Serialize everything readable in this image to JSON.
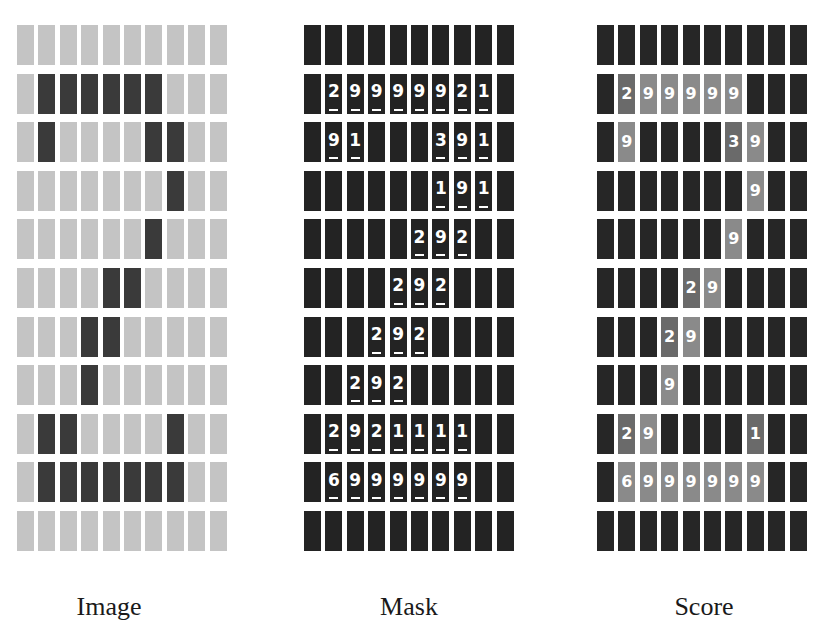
{
  "figure": {
    "rows": 11,
    "cols": 10,
    "panels": [
      {
        "id": "image",
        "caption": "Image",
        "cells": [
          [
            0,
            0,
            0,
            0,
            0,
            0,
            0,
            0,
            0,
            0
          ],
          [
            0,
            1,
            1,
            1,
            1,
            1,
            1,
            0,
            0,
            0
          ],
          [
            0,
            1,
            0,
            0,
            0,
            0,
            1,
            1,
            0,
            0
          ],
          [
            0,
            0,
            0,
            0,
            0,
            0,
            0,
            1,
            0,
            0
          ],
          [
            0,
            0,
            0,
            0,
            0,
            0,
            1,
            0,
            0,
            0
          ],
          [
            0,
            0,
            0,
            0,
            1,
            1,
            0,
            0,
            0,
            0
          ],
          [
            0,
            0,
            0,
            1,
            1,
            0,
            0,
            0,
            0,
            0
          ],
          [
            0,
            0,
            0,
            1,
            0,
            0,
            0,
            0,
            0,
            0
          ],
          [
            0,
            1,
            1,
            0,
            0,
            0,
            0,
            1,
            0,
            0
          ],
          [
            0,
            1,
            1,
            1,
            1,
            1,
            1,
            1,
            0,
            0
          ],
          [
            0,
            0,
            0,
            0,
            0,
            0,
            0,
            0,
            0,
            0
          ]
        ]
      },
      {
        "id": "mask",
        "caption": "Mask",
        "cells": [
          [
            "",
            "",
            "",
            "",
            "",
            "",
            "",
            "",
            "",
            ""
          ],
          [
            "",
            "2",
            "9",
            "9",
            "9",
            "9",
            "9",
            "2",
            "1",
            ""
          ],
          [
            "",
            "9",
            "1",
            "",
            "",
            "",
            "3",
            "9",
            "1",
            ""
          ],
          [
            "",
            "",
            "",
            "",
            "",
            "",
            "1",
            "9",
            "1",
            ""
          ],
          [
            "",
            "",
            "",
            "",
            "",
            "2",
            "9",
            "2",
            "",
            ""
          ],
          [
            "",
            "",
            "",
            "",
            "2",
            "9",
            "2",
            "",
            "",
            ""
          ],
          [
            "",
            "",
            "",
            "2",
            "9",
            "2",
            "",
            "",
            "",
            ""
          ],
          [
            "",
            "",
            "2",
            "9",
            "2",
            "",
            "",
            "",
            "",
            ""
          ],
          [
            "",
            "2",
            "9",
            "2",
            "1",
            "1",
            "1",
            "1",
            "",
            ""
          ],
          [
            "",
            "6",
            "9",
            "9",
            "9",
            "9",
            "9",
            "9",
            "",
            ""
          ],
          [
            "",
            "",
            "",
            "",
            "",
            "",
            "",
            "",
            "",
            ""
          ]
        ]
      },
      {
        "id": "score",
        "caption": "Score",
        "cells": [
          [
            "",
            "",
            "",
            "",
            "",
            "",
            "",
            "",
            "",
            ""
          ],
          [
            "",
            "2",
            "9",
            "9",
            "9",
            "9",
            "9",
            "",
            "",
            ""
          ],
          [
            "",
            "9",
            "",
            "",
            "",
            "",
            "3",
            "9",
            "",
            ""
          ],
          [
            "",
            "",
            "",
            "",
            "",
            "",
            "",
            "9",
            "",
            ""
          ],
          [
            "",
            "",
            "",
            "",
            "",
            "",
            "9",
            "",
            "",
            ""
          ],
          [
            "",
            "",
            "",
            "",
            "2",
            "9",
            "",
            "",
            "",
            ""
          ],
          [
            "",
            "",
            "",
            "2",
            "9",
            "",
            "",
            "",
            "",
            ""
          ],
          [
            "",
            "",
            "",
            "9",
            "",
            "",
            "",
            "",
            "",
            ""
          ],
          [
            "",
            "2",
            "9",
            "",
            "",
            "",
            "",
            "1",
            "",
            ""
          ],
          [
            "",
            "6",
            "9",
            "9",
            "9",
            "9",
            "9",
            "9",
            "",
            ""
          ],
          [
            "",
            "",
            "",
            "",
            "",
            "",
            "",
            "",
            "",
            ""
          ]
        ]
      }
    ],
    "colors": {
      "image_light": "#c4c4c4",
      "image_dark": "#3a3a3a",
      "mask_bg": "#232323",
      "score_bg": "#262626",
      "score_value_9": "#8a8a8a",
      "score_value_low": "#6a6a6a"
    }
  }
}
